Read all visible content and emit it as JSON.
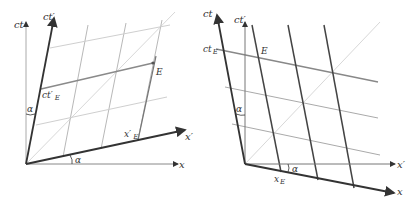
{
  "figure": {
    "colors": {
      "axis_dark": "#333333",
      "grid_light": "#bdbdbd",
      "grid_dark": "#444444",
      "light_cone": "#d0d0d0",
      "highlight": "#888888"
    }
  },
  "left_diagram": {
    "labels": {
      "ct": "ct",
      "ct_prime": "ct′",
      "x": "x",
      "x_prime": "x′",
      "event": "E",
      "ct_prime_E": "ct′",
      "ct_prime_E_sub": "E",
      "x_prime_E": "x′",
      "x_prime_E_sub": "E",
      "alpha_top": "α",
      "alpha_bottom": "α"
    }
  },
  "right_diagram": {
    "labels": {
      "ct": "ct",
      "ct_prime": "ct′",
      "x": "x",
      "x_prime": "x′",
      "event": "E",
      "ct_E": "ct",
      "ct_E_sub": "E",
      "x_E": "x",
      "x_E_sub": "E",
      "alpha_top": "α",
      "alpha_bottom": "α"
    }
  }
}
